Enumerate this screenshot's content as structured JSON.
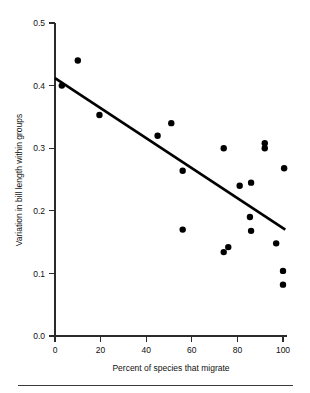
{
  "chart_data": {
    "type": "scatter",
    "title": "",
    "xlabel": "Percent of species that migrate",
    "ylabel": "Variation in bill length within groups",
    "xlim": [
      0,
      105
    ],
    "ylim": [
      0.0,
      0.5
    ],
    "xticks": [
      0,
      20,
      40,
      60,
      80,
      100
    ],
    "xtick_labels": [
      "0",
      "20",
      "40",
      "60",
      "80",
      "100"
    ],
    "yticks": [
      0.0,
      0.1,
      0.2,
      0.3,
      0.4,
      0.5
    ],
    "ytick_labels": [
      "0.0",
      "0.1",
      "0.2",
      "0.3",
      "0.4",
      "0.5"
    ],
    "grid": false,
    "legend": null,
    "points": [
      {
        "x": 3,
        "y": 0.4
      },
      {
        "x": 10,
        "y": 0.44
      },
      {
        "x": 19.5,
        "y": 0.353
      },
      {
        "x": 45,
        "y": 0.32
      },
      {
        "x": 51,
        "y": 0.34
      },
      {
        "x": 56,
        "y": 0.264
      },
      {
        "x": 56,
        "y": 0.17
      },
      {
        "x": 74,
        "y": 0.3
      },
      {
        "x": 74,
        "y": 0.134
      },
      {
        "x": 76,
        "y": 0.142
      },
      {
        "x": 81,
        "y": 0.24
      },
      {
        "x": 85.5,
        "y": 0.19
      },
      {
        "x": 86,
        "y": 0.245
      },
      {
        "x": 86,
        "y": 0.168
      },
      {
        "x": 92,
        "y": 0.308
      },
      {
        "x": 92,
        "y": 0.3
      },
      {
        "x": 97,
        "y": 0.148
      },
      {
        "x": 100.5,
        "y": 0.268
      },
      {
        "x": 100,
        "y": 0.104
      },
      {
        "x": 100,
        "y": 0.082
      }
    ],
    "fit_line": {
      "x0": 0,
      "y0": 0.412,
      "x1": 101,
      "y1": 0.17
    },
    "marker": {
      "shape": "circle",
      "color": "#000000",
      "size_px": 3.2
    },
    "line_color": "#000000",
    "axis_color": "#2b2b2b"
  }
}
